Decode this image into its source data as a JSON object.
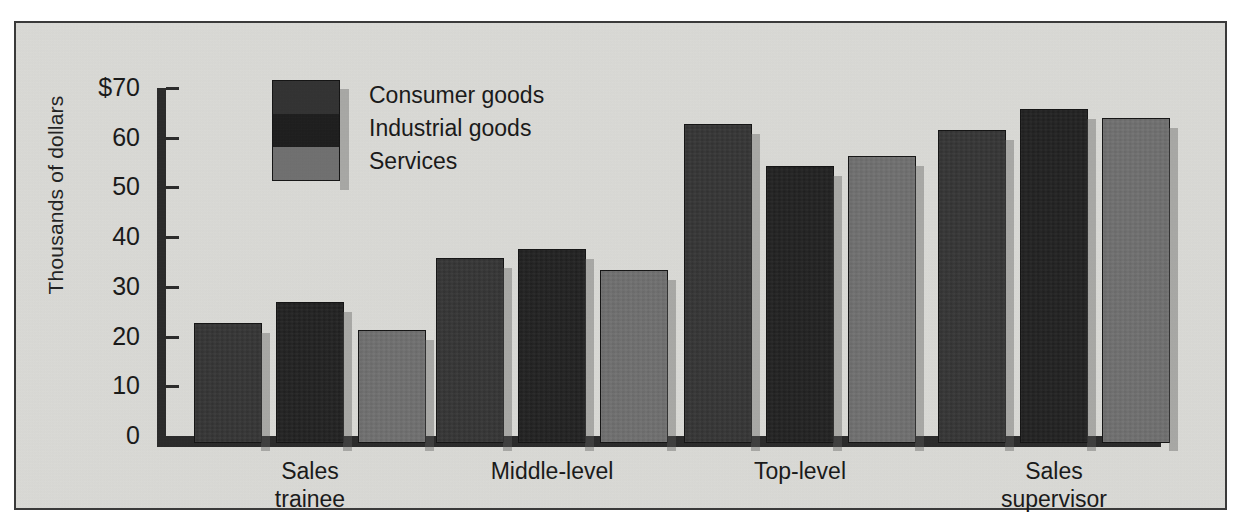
{
  "chart_data": {
    "type": "bar",
    "title": "",
    "subtitle": "",
    "xlabel": "",
    "ylabel": "Thousands of dollars",
    "ylim": [
      0,
      70
    ],
    "yticks": [
      0,
      10,
      20,
      30,
      40,
      50,
      60,
      70
    ],
    "ytick_labels": [
      "0",
      "10",
      "20",
      "30",
      "40",
      "50",
      "60",
      "$70"
    ],
    "grid": false,
    "legend_position": "top-left-inside",
    "categories": [
      "Sales\ntrainee",
      "Middle-level",
      "Top-level",
      "Sales\nsupervisor"
    ],
    "category_labels_flat": [
      "Sales trainee",
      "Middle-level",
      "Top-level",
      "Sales supervisor"
    ],
    "series": [
      {
        "name": "Consumer goods",
        "color": "#2e2e2e",
        "values": [
          24.2,
          37.3,
          64.2,
          63.0
        ]
      },
      {
        "name": "Industrial goods",
        "color": "#191919",
        "values": [
          28.4,
          39.0,
          55.8,
          67.2
        ]
      },
      {
        "name": "Services",
        "color": "#6e6e6e",
        "values": [
          22.8,
          34.8,
          57.8,
          65.4
        ]
      }
    ]
  },
  "legend": {
    "items": [
      {
        "label": "Consumer goods",
        "color": "#2e2e2e"
      },
      {
        "label": "Industrial goods",
        "color": "#191919"
      },
      {
        "label": "Services",
        "color": "#6e6e6e"
      }
    ]
  },
  "axis": {
    "y_title": "Thousands of dollars",
    "ticks": [
      {
        "label": "$70",
        "value": 70
      },
      {
        "label": "60",
        "value": 60
      },
      {
        "label": "50",
        "value": 50
      },
      {
        "label": "40",
        "value": 40
      },
      {
        "label": "30",
        "value": 30
      },
      {
        "label": "20",
        "value": 20
      },
      {
        "label": "10",
        "value": 10
      },
      {
        "label": "0",
        "value": 0
      }
    ]
  },
  "x_categories": [
    {
      "line1": "Sales",
      "line2": "trainee"
    },
    {
      "line1": "Middle-level",
      "line2": ""
    },
    {
      "line1": "Top-level",
      "line2": ""
    },
    {
      "line1": "Sales",
      "line2": "supervisor"
    }
  ],
  "colors": {
    "plate_background": "#dcdcd8",
    "frame": "#3a3a3a",
    "axis": "#262626",
    "text": "#141414",
    "shadow": "#5a5a5a"
  }
}
